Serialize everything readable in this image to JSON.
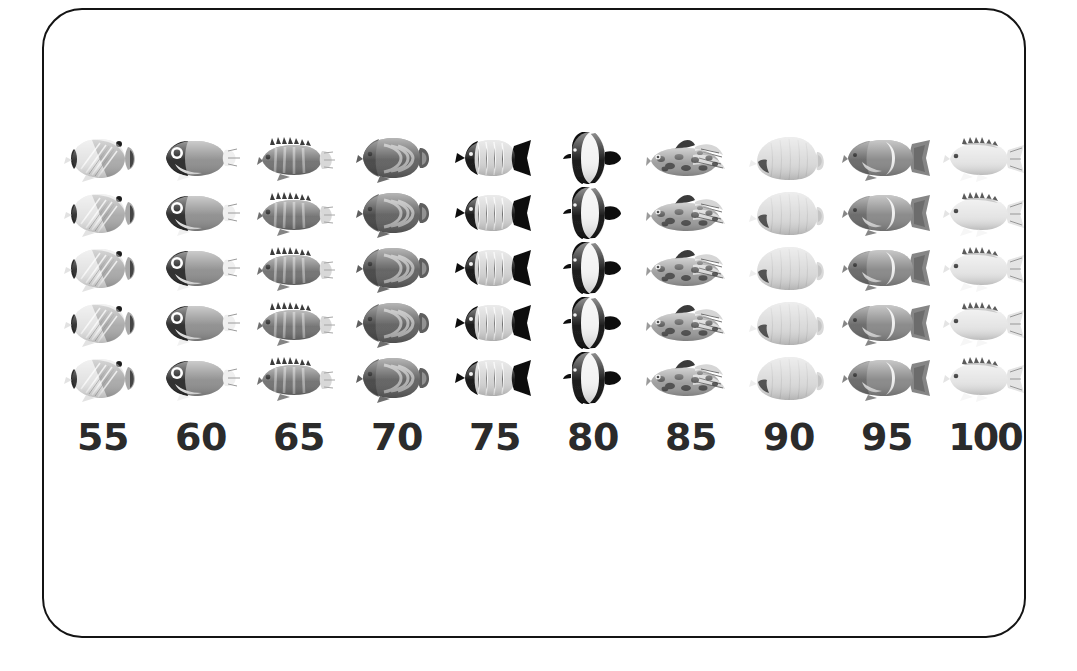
{
  "figure": {
    "type": "pictograph-array",
    "background_color": "#ffffff",
    "frame": {
      "shape": "rounded-rectangle",
      "stroke_color": "#141414",
      "stroke_width_px": 2,
      "corner_radius_px": 40
    },
    "rows": 5,
    "columns": 10,
    "icon_kind": "fish-photograph"
  },
  "labels": [
    {
      "text": "55"
    },
    {
      "text": "60"
    },
    {
      "text": "65"
    },
    {
      "text": "70"
    },
    {
      "text": "75"
    },
    {
      "text": "80"
    },
    {
      "text": "85"
    },
    {
      "text": "90"
    },
    {
      "text": "95"
    },
    {
      "text": "100"
    }
  ],
  "columns": [
    {
      "label": "55",
      "icon_name": "butterflyfish-diagonal-stripes",
      "body_color": "#a8a8a8",
      "body_light": "#e2e2e2",
      "accent_color": "#2a2a2a",
      "count": 5
    },
    {
      "label": "60",
      "icon_name": "surgeonfish-dark-head",
      "body_color": "#8d8d8d",
      "body_light": "#efefef",
      "accent_color": "#262626",
      "count": 5
    },
    {
      "label": "65",
      "icon_name": "barred-grouper",
      "body_color": "#6f6f6f",
      "body_light": "#d8d8d8",
      "accent_color": "#3a3a3a",
      "count": 5
    },
    {
      "label": "70",
      "icon_name": "angelfish-concentric-arcs",
      "body_color": "#5e5e5e",
      "body_light": "#bdbdbd",
      "accent_color": "#3c3c3c",
      "count": 5
    },
    {
      "label": "75",
      "icon_name": "butterflyfish-black-head-tail",
      "body_color": "#d2d2d2",
      "body_light": "#efefef",
      "accent_color": "#111111",
      "count": 5
    },
    {
      "label": "80",
      "icon_name": "moorish-idol-banded",
      "body_color": "#f2f2f2",
      "body_light": "#ffffff",
      "accent_color": "#111111",
      "count": 5
    },
    {
      "label": "85",
      "icon_name": "scorpionfish-mottled",
      "body_color": "#9a9a9a",
      "body_light": "#d6d6d6",
      "accent_color": "#3b3b3b",
      "count": 5
    },
    {
      "label": "90",
      "icon_name": "pale-oval-butterflyfish",
      "body_color": "#d9d9d9",
      "body_light": "#eeeeee",
      "accent_color": "#4a4a4a",
      "count": 5
    },
    {
      "label": "95",
      "icon_name": "angelfish-white-crescent",
      "body_color": "#868686",
      "body_light": "#ededed",
      "accent_color": "#4d4d4d",
      "count": 5
    },
    {
      "label": "100",
      "icon_name": "pale-sunfish-bream",
      "body_color": "#e4e4e4",
      "body_light": "#f6f6f6",
      "accent_color": "#7d7d7d",
      "count": 5
    }
  ],
  "chart_data": {
    "type": "bar",
    "subtype": "pictograph",
    "title": "",
    "xlabel": "",
    "ylabel": "",
    "categories": [
      "55",
      "60",
      "65",
      "70",
      "75",
      "80",
      "85",
      "90",
      "95",
      "100"
    ],
    "values": [
      5,
      5,
      5,
      5,
      5,
      5,
      5,
      5,
      5,
      5
    ],
    "unit": "fish icons",
    "icons_per_unit": 1,
    "ylim": [
      0,
      5
    ],
    "grid": false,
    "legend": "none"
  }
}
